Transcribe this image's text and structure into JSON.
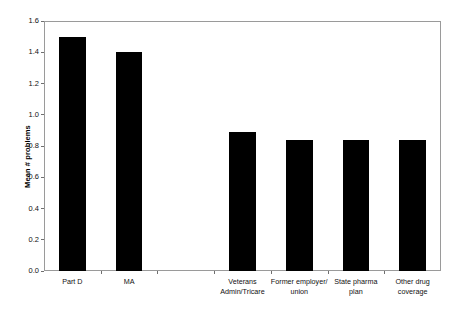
{
  "chart_data": {
    "type": "bar",
    "title": "",
    "subtitle": "",
    "xlabel": "",
    "ylabel": "Mean # problems",
    "ylim": [
      0.0,
      1.6
    ],
    "ytick_labels": [
      "0.0",
      "0.2",
      "0.4",
      "0.6",
      "0.8",
      "1.0",
      "1.2",
      "1.4",
      "1.6"
    ],
    "ytick_values": [
      0.0,
      0.2,
      0.4,
      0.6,
      0.8,
      1.0,
      1.2,
      1.4,
      1.6
    ],
    "grid": false,
    "legend": "none",
    "bar_color": "#000000",
    "axis_color": "#9a9a9a",
    "categories": [
      "Part D",
      "MA",
      "",
      "Veterans\nAdmin/Tricare",
      "Former employer/\nunion",
      "State pharma\nplan",
      "Other drug\ncoverage"
    ],
    "values": [
      1.5,
      1.4,
      null,
      0.89,
      0.84,
      0.84,
      0.84
    ],
    "series": [
      {
        "name": "Mean # problems",
        "values": [
          1.5,
          1.4,
          null,
          0.89,
          0.84,
          0.84,
          0.84
        ]
      }
    ]
  }
}
